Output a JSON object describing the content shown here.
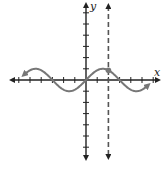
{
  "chart_data": {
    "type": "line",
    "title": "",
    "xlabel": "x",
    "ylabel": "y",
    "xlim": [
      -7,
      7
    ],
    "ylim": [
      -7,
      7
    ],
    "x_ticks": [
      -6,
      -5,
      -4,
      -3,
      -2,
      -1,
      1,
      2,
      3,
      4,
      5,
      6
    ],
    "y_ticks": [
      -6,
      -5,
      -4,
      -3,
      -2,
      -1,
      1,
      2,
      3,
      4,
      5,
      6
    ],
    "grid": false,
    "series": [
      {
        "name": "curve",
        "function": "sin(pi*x/3)",
        "x_range": [
          -5.5,
          5.5
        ],
        "color": "#777777",
        "arrows_both_ends": true
      }
    ],
    "vertical_asymptote": {
      "x": 2,
      "style": "dashed",
      "color": "#555555"
    },
    "highlight_point": {
      "x": 2,
      "y": 0.87,
      "color": "#777777"
    }
  }
}
